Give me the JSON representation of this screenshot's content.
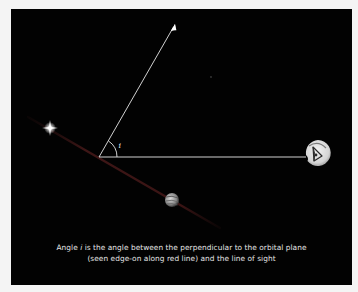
{
  "diagram": {
    "angle_label": "i",
    "caption": {
      "line1_prefix": "Angle ",
      "line1_var": "i",
      "line1_suffix": " is the angle between the perpendicular to the orbital plane",
      "line2": "(seen edge-on along red line) and the line of sight"
    },
    "elements": [
      {
        "name": "star",
        "icon": "star-icon"
      },
      {
        "name": "planet",
        "icon": "planet-icon"
      },
      {
        "name": "observer",
        "icon": "eye-icon"
      },
      {
        "name": "orbital-plane",
        "description": "red line (edge-on)"
      },
      {
        "name": "perpendicular",
        "description": "arrow"
      },
      {
        "name": "line-of-sight",
        "description": "horizontal line"
      }
    ],
    "colors": {
      "background": "#020202",
      "frame": "#f4f4f4",
      "lines": "#e8e8e8",
      "orbital_plane": "#3a1414",
      "text": "#e6e6e6"
    }
  }
}
